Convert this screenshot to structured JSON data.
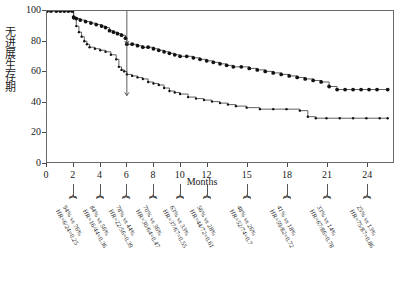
{
  "chart_data": {
    "type": "line",
    "title": "",
    "xlabel": "Months",
    "ylabel": "无进展生存期",
    "xlim": [
      0,
      26
    ],
    "ylim": [
      0,
      100
    ],
    "grid": false,
    "legend_position": "none",
    "x_ticks": [
      "0",
      "2",
      "4",
      "6",
      "8",
      "10",
      "12",
      "15",
      "18",
      "21",
      "24"
    ],
    "x_tick_values": [
      0,
      2,
      4,
      6,
      8,
      10,
      12,
      15,
      18,
      21,
      24
    ],
    "y_ticks": [
      "0",
      "20",
      "40",
      "60",
      "80",
      "100"
    ],
    "y_tick_values": [
      0,
      20,
      40,
      60,
      80,
      100
    ],
    "reference_line": {
      "x": 6,
      "y_top": 78,
      "y_bottom": 44
    },
    "series": [
      {
        "name": "upper-curve",
        "censor_marks": true,
        "points": [
          [
            0,
            100
          ],
          [
            0.3,
            100
          ],
          [
            0.7,
            100
          ],
          [
            1.0,
            100
          ],
          [
            1.3,
            100
          ],
          [
            1.6,
            100
          ],
          [
            1.9,
            100
          ],
          [
            2.0,
            96
          ],
          [
            2.2,
            95
          ],
          [
            2.5,
            94
          ],
          [
            2.9,
            93
          ],
          [
            3.3,
            92
          ],
          [
            3.7,
            91
          ],
          [
            4.1,
            90
          ],
          [
            4.4,
            89
          ],
          [
            4.7,
            87
          ],
          [
            5.0,
            86
          ],
          [
            5.3,
            85
          ],
          [
            5.6,
            84
          ],
          [
            5.9,
            82
          ],
          [
            6.0,
            78
          ],
          [
            6.4,
            78
          ],
          [
            6.8,
            77
          ],
          [
            7.2,
            76
          ],
          [
            7.6,
            76
          ],
          [
            8.0,
            75
          ],
          [
            8.4,
            74
          ],
          [
            8.8,
            73
          ],
          [
            9.2,
            72
          ],
          [
            9.6,
            71
          ],
          [
            10.0,
            70
          ],
          [
            10.5,
            70
          ],
          [
            11.0,
            69
          ],
          [
            11.5,
            68
          ],
          [
            12.0,
            67
          ],
          [
            12.5,
            66
          ],
          [
            13.0,
            65
          ],
          [
            13.5,
            64
          ],
          [
            14.0,
            63
          ],
          [
            14.6,
            63
          ],
          [
            15.2,
            62
          ],
          [
            15.8,
            61
          ],
          [
            16.4,
            60
          ],
          [
            17.0,
            59
          ],
          [
            17.6,
            58
          ],
          [
            18.2,
            57
          ],
          [
            18.8,
            56
          ],
          [
            19.4,
            55
          ],
          [
            20.0,
            54
          ],
          [
            20.6,
            53
          ],
          [
            21.2,
            50
          ],
          [
            21.8,
            48
          ],
          [
            22.4,
            48
          ],
          [
            23.0,
            48
          ],
          [
            23.6,
            48
          ],
          [
            24.2,
            48
          ],
          [
            24.8,
            48
          ],
          [
            25.6,
            48
          ]
        ]
      },
      {
        "name": "lower-curve",
        "censor_marks": true,
        "points": [
          [
            0,
            100
          ],
          [
            1.0,
            100
          ],
          [
            1.8,
            100
          ],
          [
            2.0,
            95
          ],
          [
            2.2,
            90
          ],
          [
            2.4,
            86
          ],
          [
            2.6,
            83
          ],
          [
            2.8,
            80
          ],
          [
            3.0,
            78
          ],
          [
            3.2,
            76
          ],
          [
            3.6,
            75
          ],
          [
            4.0,
            74
          ],
          [
            4.4,
            73
          ],
          [
            4.8,
            71
          ],
          [
            5.2,
            68
          ],
          [
            5.4,
            63
          ],
          [
            5.6,
            61
          ],
          [
            5.8,
            60
          ],
          [
            6.0,
            58
          ],
          [
            6.4,
            57
          ],
          [
            6.8,
            56
          ],
          [
            7.2,
            55
          ],
          [
            7.6,
            53
          ],
          [
            8.0,
            52
          ],
          [
            8.4,
            51
          ],
          [
            8.8,
            49
          ],
          [
            9.2,
            47
          ],
          [
            9.6,
            46
          ],
          [
            10.0,
            45
          ],
          [
            10.6,
            43
          ],
          [
            11.2,
            42
          ],
          [
            11.8,
            41
          ],
          [
            12.4,
            40
          ],
          [
            13.0,
            39
          ],
          [
            13.6,
            38
          ],
          [
            14.2,
            37
          ],
          [
            15.0,
            36
          ],
          [
            16.0,
            35
          ],
          [
            17.0,
            35
          ],
          [
            18.0,
            35
          ],
          [
            19.0,
            34
          ],
          [
            19.6,
            30
          ],
          [
            20.2,
            29
          ],
          [
            21.0,
            29
          ],
          [
            22.0,
            29
          ],
          [
            23.0,
            29
          ],
          [
            24.0,
            29
          ],
          [
            25.0,
            29
          ],
          [
            25.6,
            29
          ]
        ]
      }
    ],
    "annotations": [
      {
        "at_month": 2,
        "rates": "94% vs 76%",
        "hr": "HR=6/24=0.25"
      },
      {
        "at_month": 4,
        "rates": "84% vs 56%",
        "hr": "HR=16/44=0.36"
      },
      {
        "at_month": 6,
        "rates": "78% vs 44%",
        "hr": "HR=22/56=0.39"
      },
      {
        "at_month": 8,
        "rates": "70% vs 36%",
        "hr": "HR=30/64=0.47"
      },
      {
        "at_month": 10,
        "rates": "63% vs 33%",
        "hr": "HR=37/67=0.55"
      },
      {
        "at_month": 12,
        "rates": "56% vs 28%",
        "hr": "HR=44/72=0.61"
      },
      {
        "at_month": 15,
        "rates": "48% vs 26%",
        "hr": "HR=52/74=0.7"
      },
      {
        "at_month": 18,
        "rates": "41% vs 18%",
        "hr": "HR=59/82=0.72"
      },
      {
        "at_month": 21,
        "rates": "33% vs 14%",
        "hr": "HR=67/86=0.78"
      },
      {
        "at_month": 24,
        "rates": "25% vs 13%",
        "hr": "HR=75/87=0.86"
      }
    ]
  }
}
